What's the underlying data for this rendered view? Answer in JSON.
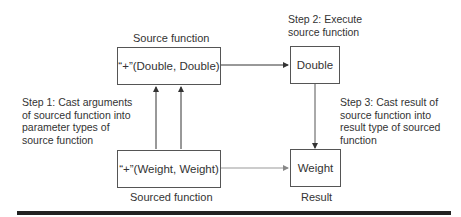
{
  "diagram": {
    "source": {
      "caption": "Source function",
      "box_text": "“+”(Double, Double)"
    },
    "double_box": {
      "text": "Double"
    },
    "sourced": {
      "caption": "Sourced function",
      "box_text": "“+”(Weight, Weight)"
    },
    "weight_box": {
      "text": "Weight",
      "caption": "Result"
    },
    "steps": {
      "step1": [
        "Step 1: Cast arguments",
        "of sourced function into",
        "parameter types of",
        "source function"
      ],
      "step2": [
        "Step 2: Execute",
        "source function"
      ],
      "step3": [
        "Step 3: Cast result of",
        "source function into",
        "result type of sourced",
        "function"
      ]
    },
    "colors": {
      "line": "#333333",
      "light_line": "#888888",
      "rule": "#222222"
    }
  }
}
